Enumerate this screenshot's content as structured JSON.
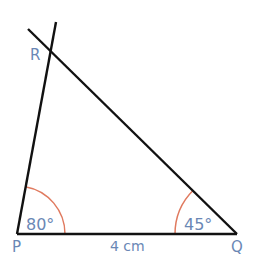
{
  "diagram": {
    "type": "triangle-construction",
    "vertices": {
      "P": {
        "label": "P"
      },
      "Q": {
        "label": "Q"
      },
      "R": {
        "label": "R"
      }
    },
    "angles": {
      "P": {
        "label": "80°",
        "value": 80
      },
      "Q": {
        "label": "45°",
        "value": 45
      }
    },
    "sides": {
      "PQ": {
        "label": "4 cm",
        "length_cm": 4
      }
    },
    "colors": {
      "line": "#111111",
      "arc": "#e07a5f",
      "label": "#6a87b5"
    }
  }
}
